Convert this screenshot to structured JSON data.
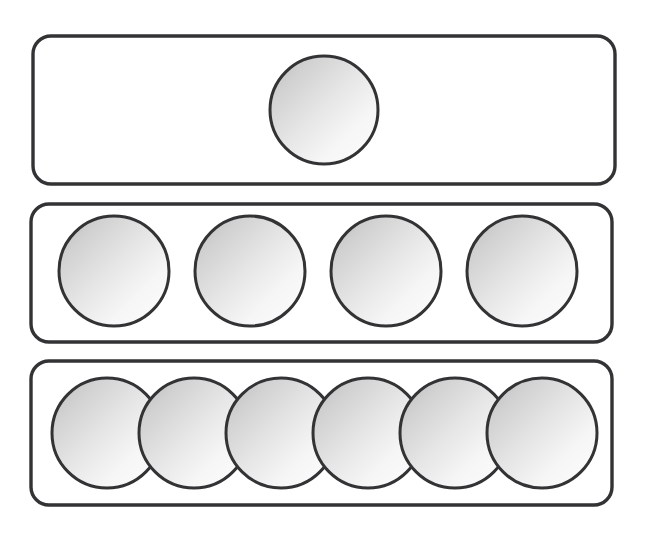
{
  "canvas": {
    "width": 646,
    "height": 538,
    "background_color": "#ffffff"
  },
  "style": {
    "outline_color": "#333335",
    "outline_width": 3.4,
    "counter_outline_color": "#333335",
    "counter_outline_width": 3.0,
    "counter_fill_light": "#fdfdfd",
    "counter_fill_mid": "#e8e8e8",
    "counter_fill_dark": "#bcbcbc",
    "bar_fill": "#ffffff",
    "bar_corner_radius": 18
  },
  "diagram": {
    "type": "counter-groups",
    "group_count": 3,
    "total_counters": 11,
    "counter_shape": "circle"
  },
  "groups": [
    {
      "name": "group-1",
      "label": "1",
      "count": 1,
      "bar": {
        "x": 33,
        "y": 36,
        "width": 582,
        "height": 148,
        "rx": 18
      },
      "counter_radius": 54,
      "counters": [
        {
          "cx": 324,
          "cy": 110,
          "r": 54
        }
      ]
    },
    {
      "name": "group-2",
      "label": "4",
      "count": 4,
      "bar": {
        "x": 31,
        "y": 204,
        "width": 581,
        "height": 138,
        "rx": 18
      },
      "counter_radius": 55,
      "counters": [
        {
          "cx": 114,
          "cy": 271,
          "r": 55
        },
        {
          "cx": 250,
          "cy": 271,
          "r": 55
        },
        {
          "cx": 386,
          "cy": 271,
          "r": 55
        },
        {
          "cx": 522,
          "cy": 271,
          "r": 55
        }
      ]
    },
    {
      "name": "group-3",
      "label": "6",
      "count": 6,
      "bar": {
        "x": 31,
        "y": 361,
        "width": 581,
        "height": 144,
        "rx": 18
      },
      "counter_radius": 55,
      "counters": [
        {
          "cx": 107,
          "cy": 433,
          "r": 55
        },
        {
          "cx": 194,
          "cy": 433,
          "r": 55
        },
        {
          "cx": 281,
          "cy": 433,
          "r": 55
        },
        {
          "cx": 368,
          "cy": 433,
          "r": 55
        },
        {
          "cx": 455,
          "cy": 433,
          "r": 55
        },
        {
          "cx": 542,
          "cy": 433,
          "r": 55
        }
      ]
    }
  ]
}
